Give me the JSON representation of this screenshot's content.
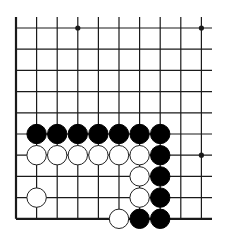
{
  "board": {
    "title": "Go problem diagram",
    "columns": 10,
    "rows": 10,
    "edges": {
      "left": true,
      "bottom": true,
      "top": false,
      "right": false
    },
    "colors": {
      "line": "#1a1a1a",
      "black_stone": "#000000",
      "white_stone": "#ffffff",
      "background": "#ffffff"
    },
    "star_points": [
      {
        "col": 3,
        "row": 0
      },
      {
        "col": 9,
        "row": 0
      },
      {
        "col": 9,
        "row": 6
      }
    ],
    "stones": [
      {
        "color": "black",
        "col": 1,
        "row": 5
      },
      {
        "color": "black",
        "col": 2,
        "row": 5
      },
      {
        "color": "black",
        "col": 3,
        "row": 5
      },
      {
        "color": "black",
        "col": 4,
        "row": 5
      },
      {
        "color": "black",
        "col": 5,
        "row": 5
      },
      {
        "color": "black",
        "col": 6,
        "row": 5
      },
      {
        "color": "black",
        "col": 7,
        "row": 5
      },
      {
        "color": "white",
        "col": 1,
        "row": 6
      },
      {
        "color": "white",
        "col": 2,
        "row": 6
      },
      {
        "color": "white",
        "col": 3,
        "row": 6
      },
      {
        "color": "white",
        "col": 4,
        "row": 6
      },
      {
        "color": "white",
        "col": 5,
        "row": 6
      },
      {
        "color": "white",
        "col": 6,
        "row": 6
      },
      {
        "color": "black",
        "col": 7,
        "row": 6
      },
      {
        "color": "white",
        "col": 6,
        "row": 7
      },
      {
        "color": "black",
        "col": 7,
        "row": 7
      },
      {
        "color": "white",
        "col": 1,
        "row": 8
      },
      {
        "color": "white",
        "col": 6,
        "row": 8
      },
      {
        "color": "black",
        "col": 7,
        "row": 8
      },
      {
        "color": "white",
        "col": 5,
        "row": 9
      },
      {
        "color": "black",
        "col": 6,
        "row": 9
      },
      {
        "color": "black",
        "col": 7,
        "row": 9
      }
    ]
  }
}
